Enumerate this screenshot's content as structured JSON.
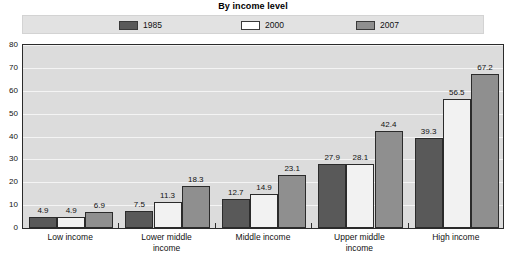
{
  "chart_data": {
    "type": "bar",
    "title": "By income level",
    "xlabel": "",
    "ylabel": "",
    "ylim": [
      0,
      80
    ],
    "yticks": [
      0,
      10,
      20,
      30,
      40,
      50,
      60,
      70,
      80
    ],
    "grid": true,
    "legend_position": "top",
    "categories": [
      "Low income",
      "Lower middle income",
      "Middle income",
      "Upper middle income",
      "High income"
    ],
    "series": [
      {
        "name": "1985",
        "color": "#595959",
        "values": [
          4.9,
          7.5,
          12.7,
          27.9,
          39.3
        ]
      },
      {
        "name": "2000",
        "color": "#f2f2f2",
        "values": [
          4.9,
          11.3,
          14.9,
          28.1,
          56.5
        ]
      },
      {
        "name": "2007",
        "color": "#8f8f8f",
        "values": [
          6.9,
          18.3,
          23.1,
          42.4,
          67.2
        ]
      }
    ]
  },
  "legend": {
    "items": [
      {
        "label": "1985",
        "color": "#595959"
      },
      {
        "label": "2000",
        "color": "#ffffff"
      },
      {
        "label": "2007",
        "color": "#8f8f8f"
      }
    ]
  },
  "axis": {
    "y_tick_labels": [
      "0",
      "10",
      "20",
      "30",
      "40",
      "50",
      "60",
      "70",
      "80"
    ]
  },
  "x_axis": {
    "labels": [
      [
        "Low income"
      ],
      [
        "Lower middle",
        "income"
      ],
      [
        "Middle income"
      ],
      [
        "Upper middle",
        "income"
      ],
      [
        "High income"
      ]
    ]
  }
}
